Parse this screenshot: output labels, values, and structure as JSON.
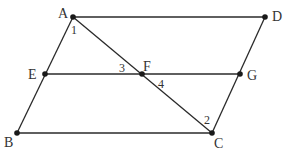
{
  "diagram": {
    "type": "geometry",
    "points": {
      "A": {
        "x": 73,
        "y": 17,
        "label": "A"
      },
      "D": {
        "x": 265,
        "y": 17,
        "label": "D"
      },
      "E": {
        "x": 45,
        "y": 74,
        "label": "E"
      },
      "F": {
        "x": 142,
        "y": 74,
        "label": "F"
      },
      "G": {
        "x": 240,
        "y": 74,
        "label": "G"
      },
      "B": {
        "x": 17,
        "y": 133,
        "label": "B"
      },
      "C": {
        "x": 212,
        "y": 133,
        "label": "C"
      }
    },
    "segments": [
      [
        "A",
        "D"
      ],
      [
        "A",
        "B"
      ],
      [
        "D",
        "C"
      ],
      [
        "B",
        "C"
      ],
      [
        "E",
        "G"
      ],
      [
        "A",
        "C"
      ]
    ],
    "angle_labels": {
      "a1": "1",
      "a2": "2",
      "a3": "3",
      "a4": "4"
    },
    "colors": {
      "line": "#2a2a2a",
      "point": "#1a1a1a",
      "text": "#333333",
      "background": "#ffffff"
    }
  }
}
